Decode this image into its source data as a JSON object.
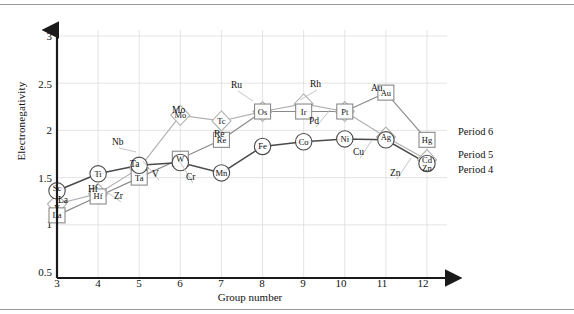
{
  "axes": {
    "y_label": "Electronegativity",
    "x_label": "Group number",
    "y_ticks": [
      "0.5",
      "1",
      "1.5",
      "2",
      "2.5",
      "3"
    ],
    "x_ticks": [
      "3",
      "4",
      "5",
      "6",
      "7",
      "8",
      "9",
      "10",
      "11",
      "12"
    ]
  },
  "legend": {
    "period6": "Period 6",
    "period5": "Period 5",
    "period4": "Period 4"
  },
  "colors": {
    "period4": "#4a4a4a",
    "period5": "#b0b0b0",
    "period6": "#8a8a8a",
    "axis": "#1a1a1a",
    "grid": "#d8d8d8"
  },
  "chart_data": {
    "type": "line",
    "title": "",
    "xlabel": "Group number",
    "ylabel": "Electronegativity",
    "xlim": [
      3,
      12
    ],
    "ylim": [
      0.5,
      3
    ],
    "grid": true,
    "legend_position": "right",
    "x": [
      3,
      4,
      5,
      6,
      7,
      8,
      9,
      10,
      11,
      12
    ],
    "series": [
      {
        "name": "Period 4",
        "marker": "circle",
        "color": "#4a4a4a",
        "symbols": [
          "Sc",
          "Ti",
          "V",
          "Cr",
          "Mn",
          "Fe",
          "Co",
          "Ni",
          "Cu",
          "Zn"
        ],
        "values": [
          1.36,
          1.54,
          1.63,
          1.66,
          1.55,
          1.83,
          1.88,
          1.91,
          1.9,
          1.65
        ]
      },
      {
        "name": "Period 5",
        "marker": "diamond",
        "color": "#b0b0b0",
        "symbols": [
          "Y",
          "Zr",
          "Nb",
          "Mo",
          "Tc",
          "Ru",
          "Rh",
          "Pd",
          "Ag",
          "Cd"
        ],
        "values": [
          1.22,
          1.33,
          1.6,
          2.16,
          2.1,
          2.2,
          2.28,
          2.2,
          1.93,
          1.69
        ]
      },
      {
        "name": "Period 6",
        "marker": "square",
        "color": "#8a8a8a",
        "symbols": [
          "La",
          "Hf",
          "Ta",
          "W",
          "Re",
          "Os",
          "Ir",
          "Pt",
          "Au",
          "Hg"
        ],
        "values": [
          1.1,
          1.3,
          1.5,
          1.7,
          1.9,
          2.2,
          2.2,
          2.2,
          2.4,
          1.9
        ]
      }
    ],
    "annotations": [
      {
        "text": "Sc",
        "series": "Period 4",
        "x": 3
      },
      {
        "text": "Ti",
        "series": "Period 4",
        "x": 4
      },
      {
        "text": "V",
        "series": "Period 4",
        "x": 5
      },
      {
        "text": "Cr",
        "series": "Period 4",
        "x": 6
      },
      {
        "text": "Mn",
        "series": "Period 4",
        "x": 7
      },
      {
        "text": "Fe",
        "series": "Period 4",
        "x": 8
      },
      {
        "text": "Co",
        "series": "Period 4",
        "x": 9
      },
      {
        "text": "Ni",
        "series": "Period 4",
        "x": 10
      },
      {
        "text": "Cu",
        "series": "Period 4",
        "x": 11
      },
      {
        "text": "Zn",
        "series": "Period 4",
        "x": 12
      },
      {
        "text": "Y",
        "series": "Period 5",
        "x": 3
      },
      {
        "text": "Zr",
        "series": "Period 5",
        "x": 4
      },
      {
        "text": "Nb",
        "series": "Period 5",
        "x": 5
      },
      {
        "text": "Mo",
        "series": "Period 5",
        "x": 6
      },
      {
        "text": "Tc",
        "series": "Period 5",
        "x": 7
      },
      {
        "text": "Ru",
        "series": "Period 5",
        "x": 8
      },
      {
        "text": "Rh",
        "series": "Period 5",
        "x": 9
      },
      {
        "text": "Pd",
        "series": "Period 5",
        "x": 10
      },
      {
        "text": "Ag",
        "series": "Period 5",
        "x": 11
      },
      {
        "text": "Cd",
        "series": "Period 5",
        "x": 12
      },
      {
        "text": "La",
        "series": "Period 6",
        "x": 3
      },
      {
        "text": "Hf",
        "series": "Period 6",
        "x": 4
      },
      {
        "text": "Ta",
        "series": "Period 6",
        "x": 5
      },
      {
        "text": "W",
        "series": "Period 6",
        "x": 6
      },
      {
        "text": "Re",
        "series": "Period 6",
        "x": 7
      },
      {
        "text": "Os",
        "series": "Period 6",
        "x": 8
      },
      {
        "text": "Ir",
        "series": "Period 6",
        "x": 9
      },
      {
        "text": "Pt",
        "series": "Period 6",
        "x": 10
      },
      {
        "text": "Au",
        "series": "Period 6",
        "x": 11
      },
      {
        "text": "Hg",
        "series": "Period 6",
        "x": 12
      }
    ]
  }
}
